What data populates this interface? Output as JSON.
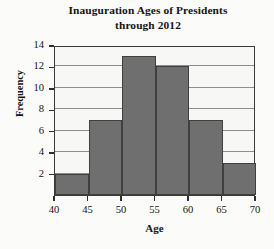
{
  "chart_data": {
    "type": "bar",
    "title": "Inauguration Ages of Presidents through 2012",
    "title_lines": [
      "Inauguration Ages of Presidents",
      "through 2012"
    ],
    "xlabel": "Age",
    "ylabel": "Frequency",
    "categories": [
      "40-45",
      "45-50",
      "50-55",
      "55-60",
      "60-65",
      "65-70"
    ],
    "bin_edges": [
      40,
      45,
      50,
      55,
      60,
      65,
      70
    ],
    "values": [
      2,
      7,
      13,
      12,
      7,
      3
    ],
    "xlim": [
      40,
      70
    ],
    "ylim": [
      0,
      14
    ],
    "xticks": [
      40,
      45,
      50,
      55,
      60,
      65,
      70
    ],
    "xtick_labels": [
      "40",
      "45",
      "50",
      "55",
      "60",
      "65",
      "70"
    ],
    "yticks": [
      2,
      4,
      6,
      8,
      10,
      12,
      14
    ],
    "ytick_labels": [
      "2",
      "4",
      "6",
      "8",
      "10",
      "12",
      "14"
    ],
    "grid": "horizontal",
    "legend": "none",
    "bar_color": "#6f6f6f",
    "bar_edge_color": "#3f3f3f",
    "gridline_color": "#8d8d8d",
    "plot_background": "#f7f7f6",
    "axis_color": "#3a3a3a"
  }
}
